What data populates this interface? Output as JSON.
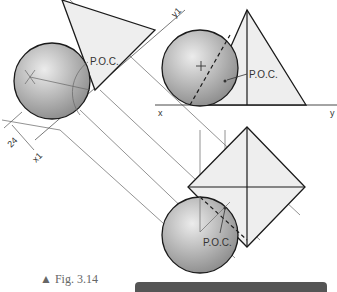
{
  "figure": {
    "caption_marker": "▲",
    "caption": "Fig. 3.14",
    "labels": {
      "poc_aux": "P.O.C.",
      "poc_front": "P.O.C.",
      "poc_top": "P.O.C.",
      "x": "x",
      "y": "y",
      "x1": "x1",
      "y1": "y1",
      "dimension": "24"
    },
    "colors": {
      "line": "#1a1a1a",
      "projector": "#777777",
      "pyramid_fill": "#eeeeee",
      "sphere_light": "#e6e6e6",
      "sphere_dark": "#8f8f8f",
      "caption_bar": "#555555"
    }
  }
}
